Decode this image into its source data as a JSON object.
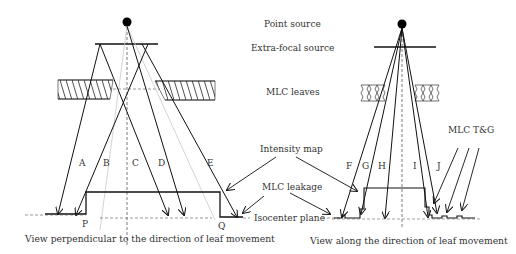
{
  "labels": {
    "point_source": "Point source",
    "extra_focal_source": "Extra-focal source",
    "mlc_leaves": "MLC leaves",
    "intensity_map": "Intensity map",
    "mlc_leakage": "MLC leakage",
    "isocenter_plane": "Isocenter plane",
    "mlc_tg": "MLC T&G"
  },
  "left_view": {
    "caption": "View perpendicular to the direction of leaf movement",
    "rays": [
      "A",
      "B",
      "C",
      "D",
      "E"
    ],
    "points": [
      "P",
      "Q"
    ]
  },
  "right_view": {
    "caption": "View along the direction of leaf movement",
    "rays": [
      "F",
      "G",
      "H",
      "I",
      "J"
    ]
  },
  "colors": {
    "line": "#111111",
    "faint_line": "#bbbbbb",
    "text": "#333333"
  }
}
